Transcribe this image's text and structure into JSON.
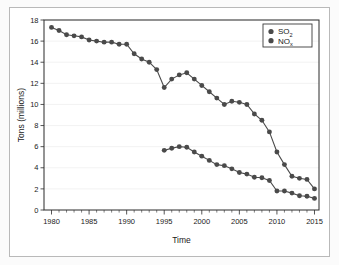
{
  "chart_data": {
    "type": "line",
    "title": "",
    "xlabel": "Time",
    "ylabel": "Tons (millions)",
    "xlim": [
      1979,
      2015.6
    ],
    "ylim": [
      0,
      18
    ],
    "yticks": [
      0,
      2,
      4,
      6,
      8,
      10,
      12,
      14,
      16,
      18
    ],
    "ytick_labels": [
      "0",
      "2",
      "4",
      "6",
      "8",
      "10",
      "12",
      "14",
      "16",
      "18"
    ],
    "xticks": [
      1980,
      1985,
      1990,
      1995,
      2000,
      2005,
      2010,
      2015
    ],
    "xtick_labels": [
      "1980",
      "1985",
      "1990",
      "1995",
      "2000",
      "2005",
      "2010",
      "2015"
    ],
    "minor_xtick_interval": 1,
    "grid": true,
    "grid_axis": "y",
    "legend_position": "top-right",
    "marker": "circle",
    "series": [
      {
        "name": "SO2",
        "legend_base": "SO",
        "legend_sub": "2",
        "color": "#4a4a4a",
        "x": [
          1980,
          1981,
          1982,
          1983,
          1984,
          1985,
          1986,
          1987,
          1988,
          1989,
          1990,
          1991,
          1992,
          1993,
          1994,
          1995,
          1996,
          1997,
          1998,
          1999,
          2000,
          2001,
          2002,
          2003,
          2004,
          2005,
          2006,
          2007,
          2008,
          2009,
          2010,
          2011,
          2012,
          2013,
          2014,
          2015
        ],
        "values": [
          17.3,
          17.0,
          16.6,
          16.5,
          16.4,
          16.1,
          16.0,
          15.9,
          15.9,
          15.7,
          15.7,
          14.8,
          14.3,
          14.0,
          13.3,
          11.6,
          12.4,
          12.8,
          13.0,
          12.4,
          11.8,
          11.2,
          10.6,
          10.0,
          10.3,
          10.2,
          10.0,
          9.1,
          8.5,
          7.4,
          5.5,
          4.3,
          3.2,
          3.0,
          2.9,
          2.0
        ]
      },
      {
        "name": "NOx",
        "legend_base": "NO",
        "legend_sub": "x",
        "color": "#4a4a4a",
        "x": [
          1995,
          1996,
          1997,
          1998,
          1999,
          2000,
          2001,
          2002,
          2003,
          2004,
          2005,
          2006,
          2007,
          2008,
          2009,
          2010,
          2011,
          2012,
          2013,
          2014,
          2015
        ],
        "values": [
          5.65,
          5.85,
          6.0,
          5.95,
          5.5,
          5.1,
          4.7,
          4.3,
          4.2,
          3.9,
          3.55,
          3.4,
          3.1,
          3.05,
          2.8,
          1.8,
          1.8,
          1.6,
          1.35,
          1.3,
          1.1
        ]
      }
    ]
  },
  "legend": {
    "entries": [
      {
        "label": "SO2",
        "base": "SO",
        "sub": "2"
      },
      {
        "label": "NOx",
        "base": "NO",
        "sub": "x"
      }
    ]
  },
  "axes": {
    "x_title": "Time",
    "y_title": "Tons (millions)"
  }
}
